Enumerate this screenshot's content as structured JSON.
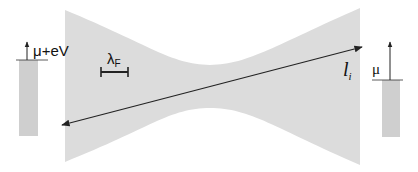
{
  "diagram": {
    "type": "quantum point contact schematic",
    "labels": {
      "left_reservoir": "μ+eV",
      "right_reservoir": "μ",
      "fermi_wavelength_main": "λ",
      "fermi_wavelength_sub": "F",
      "path_length_main": "l",
      "path_length_sub": "i"
    },
    "colors": {
      "constriction_fill": "#dcdcdc",
      "reservoir_fill": "#cfcfcf",
      "line": "#222222",
      "background": "#ffffff"
    }
  }
}
